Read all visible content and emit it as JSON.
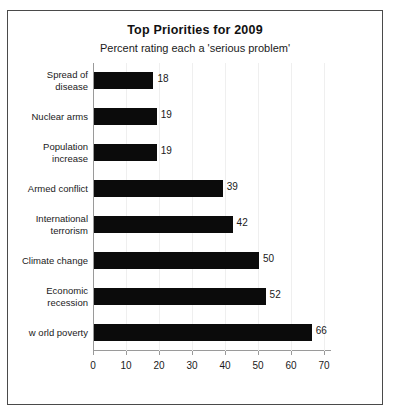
{
  "chart_data": {
    "type": "bar",
    "orientation": "horizontal",
    "title": "Top Priorities for 2009",
    "subtitle": "Percent rating each a 'serious problem'",
    "xlabel": "",
    "ylabel": "",
    "xlim": [
      0,
      70
    ],
    "xticks": [
      0,
      10,
      20,
      30,
      40,
      50,
      60,
      70
    ],
    "xtick_labels": [
      "0",
      "10",
      "20",
      "30",
      "40",
      "50",
      "60",
      "70"
    ],
    "grid": false,
    "legend": false,
    "bar_color": "#0b0b0b",
    "data_labels": true,
    "categories": [
      "Spread of\ndisease",
      "Nuclear arms",
      "Population\nincrease",
      "Armed conflict",
      "International\nterrorism",
      "Climate change",
      "Economic\nrecession",
      "w orld poverty"
    ],
    "values": [
      18,
      19,
      19,
      39,
      42,
      50,
      52,
      66
    ],
    "value_labels": [
      "18",
      "19",
      "19",
      "39",
      "42",
      "50",
      "52",
      "66"
    ]
  }
}
